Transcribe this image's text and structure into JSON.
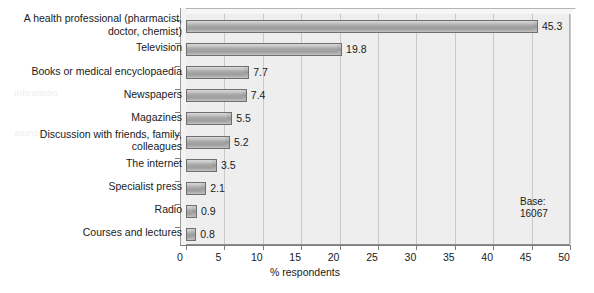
{
  "chart_data": {
    "type": "bar",
    "orientation": "horizontal",
    "title": "",
    "xlabel": "% respondents",
    "ylabel": "",
    "xlim": [
      0,
      50
    ],
    "xticks": [
      "0",
      "5",
      "10",
      "15",
      "20",
      "25",
      "30",
      "35",
      "40",
      "45",
      "50"
    ],
    "grid": true,
    "legend": "none",
    "categories": [
      "A health professional (pharmacist, doctor, chemist)",
      "Television",
      "Books or medical encyclopaedia",
      "Newspapers",
      "Magazines",
      "Discussion with friends, family, colleagues",
      "The internet",
      "Specialist press",
      "Radio",
      "Courses and lectures"
    ],
    "values": [
      45.3,
      19.8,
      7.7,
      7.4,
      5.5,
      5.2,
      3.5,
      2.1,
      0.9,
      0.8
    ],
    "value_labels": [
      "45.3",
      "19.8",
      "7.7",
      "7.4",
      "5.5",
      "5.2",
      "3.5",
      "2.1",
      "0.9",
      "0.8"
    ],
    "annotations": [
      {
        "name": "base-note",
        "line1": "Base:",
        "line2": "16067"
      }
    ],
    "colors": {
      "bar_fill": "#a8a8a8",
      "bar_edge": "#6f6f6f",
      "plot_background": "#eeeeee",
      "gridline": "#c9c9c9",
      "text": "#1a1a1a"
    }
  },
  "category_label_lines": [
    [
      "A health professional (pharmacist,",
      "doctor, chemist)"
    ],
    [
      "Television"
    ],
    [
      "Books or medical encyclopaedia"
    ],
    [
      "Newspapers"
    ],
    [
      "Magazines"
    ],
    [
      "Discussion with friends, family,",
      "colleagues"
    ],
    [
      "The internet"
    ],
    [
      "Specialist press"
    ],
    [
      "Radio"
    ],
    [
      "Courses and lectures"
    ]
  ],
  "bleed_through": {
    "title": "anslation of Nutritio",
    "subtitle": "nutrition",
    "left_1": "oitamrofni",
    "left_2": "secruos"
  }
}
